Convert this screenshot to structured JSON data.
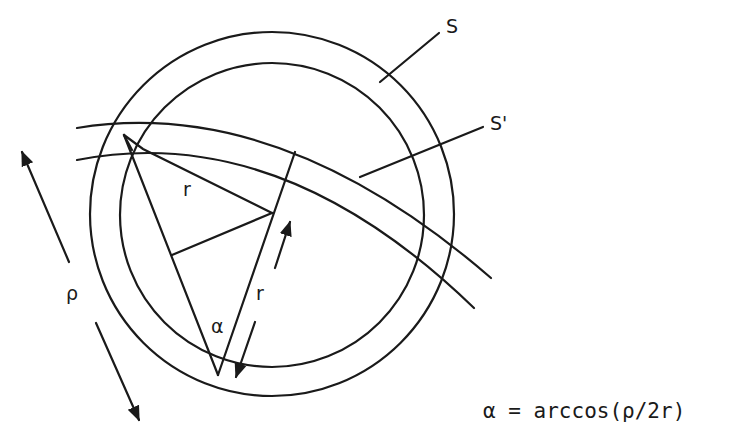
{
  "diagram": {
    "labels": {
      "outer_circle": "S",
      "inner_circle": "S'",
      "radius_top": "r",
      "radius_side": "r",
      "distance": "ρ",
      "angle": "α"
    },
    "formula": "α = arccos(ρ/2r)",
    "colors": {
      "line": "#1a1a1a",
      "background": "#ffffff"
    }
  }
}
